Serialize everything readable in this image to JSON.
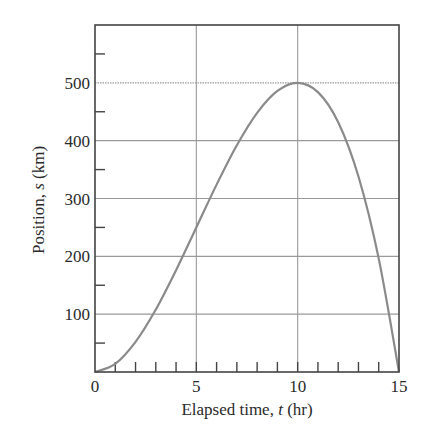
{
  "chart_data": {
    "type": "line",
    "title": "",
    "xlabel": "Elapsed time, t (hr)",
    "ylabel": "Position, s (km)",
    "xlabel_parts": {
      "prefix": "Elapsed time, ",
      "var": "t",
      "suffix": " (hr)"
    },
    "ylabel_parts": {
      "prefix": "Position, ",
      "var": "s",
      "suffix": " (km)"
    },
    "xlim": [
      0,
      15
    ],
    "ylim": [
      0,
      600
    ],
    "x_ticks_labeled": [
      0,
      5,
      10,
      15
    ],
    "x_tick_labels": [
      "0",
      "5",
      "10",
      "15"
    ],
    "x_minor_tick_step": 1,
    "y_ticks_labeled": [
      100,
      200,
      300,
      400,
      500
    ],
    "y_tick_labels": [
      "100",
      "200",
      "300",
      "400",
      "500"
    ],
    "y_minor_ticks": [
      50,
      150,
      250,
      350,
      450,
      550
    ],
    "grid": true,
    "grid_x": [
      5,
      10
    ],
    "grid_y": [
      100,
      200,
      300,
      400,
      500
    ],
    "legend": null,
    "series": [
      {
        "name": "s(t) = t^2 (15 - t)",
        "color": "#8a8a8a",
        "x": [
          0,
          1,
          2,
          3,
          4,
          5,
          6,
          7,
          8,
          9,
          10,
          11,
          12,
          13,
          14,
          15
        ],
        "y": [
          0,
          14,
          52,
          108,
          176,
          250,
          324,
          392,
          448,
          486,
          500,
          484,
          432,
          338,
          196,
          0
        ]
      }
    ]
  }
}
